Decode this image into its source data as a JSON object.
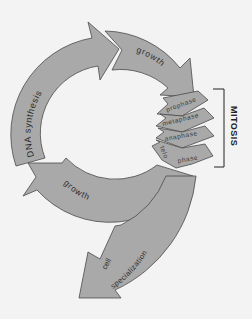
{
  "diagram": {
    "type": "cell cycle",
    "stages": [
      {
        "id": "dna-synthesis",
        "label": "DNA synthesis"
      },
      {
        "id": "growth-1",
        "label": "growth"
      },
      {
        "id": "mitosis",
        "label": "MITOSIS",
        "phases": [
          {
            "label": "prophase"
          },
          {
            "label": "metaphase"
          },
          {
            "label": "anaphase"
          },
          {
            "label": "telophase",
            "label_part1": "telo",
            "label_part2": "phase"
          }
        ]
      },
      {
        "id": "growth-2",
        "label": "growth"
      },
      {
        "id": "cell-specialization",
        "label_line1": "cell",
        "label_line2": "specialization"
      }
    ],
    "colors": {
      "background": "#f3f3f3",
      "arrow_fill": "#a9a9a9",
      "arrow_stroke": "#4a4a4a",
      "text": "#2b2b2b"
    }
  }
}
